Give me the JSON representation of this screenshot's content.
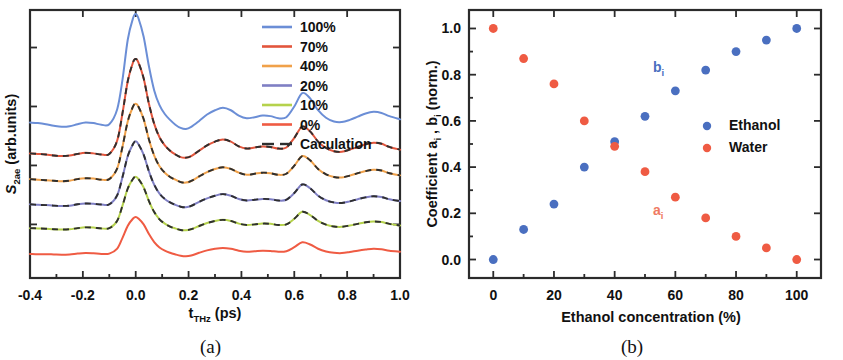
{
  "figure": {
    "width": 843,
    "height": 360,
    "background": "#ffffff"
  },
  "panel_a": {
    "caption": "(a)",
    "xlabel_main": "t",
    "xlabel_sub": "THz",
    "xlabel_unit": " (ps)",
    "ylabel_main": "S",
    "ylabel_sub": "2ae",
    "ylabel_unit": " (arb.units)",
    "legend": [
      {
        "label": "100%",
        "color": "#6b8ed6"
      },
      {
        "label": "70%",
        "color": "#e2553c"
      },
      {
        "label": "40%",
        "color": "#f0a14a"
      },
      {
        "label": "20%",
        "color": "#7f7fc4"
      },
      {
        "label": "10%",
        "color": "#b5d24c"
      },
      {
        "label": "0%",
        "color": "#ef5b43"
      },
      {
        "label": "Caculation",
        "color": "#2f2f2f",
        "dashed": true
      }
    ]
  },
  "panel_b": {
    "caption": "(b)",
    "xlabel": "Ethanol concentration (%)",
    "ylabel_pre": "Coefficient a",
    "ylabel_sub1": "i",
    "ylabel_mid": " , b",
    "ylabel_sub2": "i",
    "ylabel_post": " (norm.)",
    "legend": [
      {
        "label": "Ethanol",
        "color": "#4a6fc0"
      },
      {
        "label": "Water",
        "color": "#ef5b43"
      }
    ],
    "annotations": [
      {
        "main": "b",
        "sub": "i",
        "color": "#4a6fc0"
      },
      {
        "main": "a",
        "sub": "i",
        "color": "#ef7a63"
      }
    ]
  },
  "chart_data": [
    {
      "type": "line",
      "panel": "(a)",
      "title": "",
      "xlabel": "t_THz (ps)",
      "ylabel": "S_2ae (arb.units)",
      "xlim": [
        -0.4,
        1.0
      ],
      "ylim": [
        0,
        1
      ],
      "xticks": [
        "-0.4",
        "-0.2",
        "0.0",
        "0.2",
        "0.4",
        "0.6",
        "0.8",
        "1.0"
      ],
      "xtick_values": [
        -0.4,
        -0.2,
        0.0,
        0.2,
        0.4,
        0.6,
        0.8,
        1.0
      ],
      "yticks": [],
      "ytick_labels": [],
      "grid": false,
      "legend_position": "top-right",
      "note": "Curves are vertically offset THz waveform traces; y axis is arbitrary units with unlabeled tick marks.",
      "x": [
        -0.4,
        -0.37,
        -0.34,
        -0.31,
        -0.28,
        -0.25,
        -0.22,
        -0.19,
        -0.16,
        -0.13,
        -0.1,
        -0.07,
        -0.05,
        -0.03,
        -0.01,
        0.0,
        0.01,
        0.03,
        0.05,
        0.07,
        0.09,
        0.11,
        0.13,
        0.15,
        0.17,
        0.19,
        0.21,
        0.24,
        0.27,
        0.3,
        0.33,
        0.36,
        0.39,
        0.42,
        0.45,
        0.48,
        0.51,
        0.54,
        0.57,
        0.6,
        0.63,
        0.66,
        0.69,
        0.72,
        0.75,
        0.78,
        0.81,
        0.84,
        0.87,
        0.9,
        0.93,
        0.96,
        1.0
      ],
      "series": [
        {
          "name": "100%",
          "color": "#6b8ed6",
          "offset": 0.54,
          "values": [
            0.04,
            0.038,
            0.034,
            0.028,
            0.024,
            0.026,
            0.034,
            0.04,
            0.038,
            0.032,
            0.034,
            0.09,
            0.2,
            0.35,
            0.43,
            0.445,
            0.43,
            0.36,
            0.25,
            0.16,
            0.105,
            0.072,
            0.05,
            0.032,
            0.02,
            0.016,
            0.024,
            0.046,
            0.07,
            0.086,
            0.095,
            0.086,
            0.066,
            0.056,
            0.06,
            0.066,
            0.064,
            0.056,
            0.06,
            0.1,
            0.15,
            0.13,
            0.086,
            0.058,
            0.044,
            0.042,
            0.05,
            0.062,
            0.074,
            0.08,
            0.076,
            0.064,
            0.052
          ]
        },
        {
          "name": "70%",
          "color": "#e2553c",
          "offset": 0.435,
          "values": [
            0.03,
            0.028,
            0.026,
            0.022,
            0.02,
            0.022,
            0.028,
            0.032,
            0.03,
            0.026,
            0.028,
            0.078,
            0.18,
            0.3,
            0.37,
            0.382,
            0.37,
            0.31,
            0.215,
            0.14,
            0.09,
            0.06,
            0.04,
            0.026,
            0.016,
            0.014,
            0.02,
            0.04,
            0.06,
            0.074,
            0.082,
            0.074,
            0.056,
            0.048,
            0.052,
            0.056,
            0.054,
            0.048,
            0.052,
            0.088,
            0.13,
            0.112,
            0.074,
            0.05,
            0.038,
            0.036,
            0.044,
            0.054,
            0.064,
            0.07,
            0.066,
            0.054,
            0.044
          ]
        },
        {
          "name": "40%",
          "color": "#f0a14a",
          "offset": 0.345,
          "values": [
            0.024,
            0.022,
            0.02,
            0.018,
            0.016,
            0.018,
            0.024,
            0.027,
            0.026,
            0.022,
            0.024,
            0.064,
            0.145,
            0.24,
            0.295,
            0.305,
            0.295,
            0.248,
            0.172,
            0.112,
            0.072,
            0.048,
            0.032,
            0.022,
            0.013,
            0.011,
            0.017,
            0.034,
            0.05,
            0.062,
            0.068,
            0.062,
            0.048,
            0.04,
            0.044,
            0.048,
            0.046,
            0.04,
            0.044,
            0.074,
            0.11,
            0.094,
            0.062,
            0.042,
            0.032,
            0.03,
            0.037,
            0.046,
            0.054,
            0.059,
            0.056,
            0.046,
            0.038
          ]
        },
        {
          "name": "20%",
          "color": "#7f7fc4",
          "offset": 0.255,
          "values": [
            0.02,
            0.018,
            0.017,
            0.015,
            0.014,
            0.015,
            0.02,
            0.023,
            0.022,
            0.019,
            0.02,
            0.054,
            0.122,
            0.2,
            0.245,
            0.255,
            0.245,
            0.205,
            0.143,
            0.093,
            0.06,
            0.04,
            0.027,
            0.018,
            0.011,
            0.009,
            0.014,
            0.029,
            0.042,
            0.052,
            0.058,
            0.052,
            0.04,
            0.034,
            0.037,
            0.04,
            0.039,
            0.034,
            0.037,
            0.062,
            0.094,
            0.08,
            0.052,
            0.035,
            0.027,
            0.025,
            0.031,
            0.039,
            0.046,
            0.05,
            0.047,
            0.039,
            0.032
          ]
        },
        {
          "name": "10%",
          "color": "#b5d24c",
          "offset": 0.17,
          "values": [
            0.016,
            0.015,
            0.014,
            0.012,
            0.011,
            0.012,
            0.016,
            0.019,
            0.018,
            0.015,
            0.016,
            0.044,
            0.1,
            0.164,
            0.2,
            0.208,
            0.2,
            0.168,
            0.117,
            0.076,
            0.049,
            0.033,
            0.022,
            0.015,
            0.009,
            0.008,
            0.012,
            0.024,
            0.035,
            0.043,
            0.047,
            0.043,
            0.033,
            0.028,
            0.03,
            0.033,
            0.032,
            0.028,
            0.03,
            0.051,
            0.077,
            0.065,
            0.043,
            0.029,
            0.022,
            0.021,
            0.026,
            0.032,
            0.038,
            0.041,
            0.039,
            0.032,
            0.026
          ]
        },
        {
          "name": "0%",
          "color": "#ef5b43",
          "offset": 0.08,
          "values": [
            0.01,
            0.009,
            0.009,
            0.008,
            0.007,
            0.008,
            0.011,
            0.013,
            0.012,
            0.01,
            0.011,
            0.03,
            0.07,
            0.115,
            0.142,
            0.148,
            0.142,
            0.12,
            0.084,
            0.054,
            0.034,
            0.022,
            0.014,
            0.008,
            0.003,
            0.001,
            0.004,
            0.014,
            0.023,
            0.029,
            0.032,
            0.029,
            0.022,
            0.018,
            0.02,
            0.022,
            0.021,
            0.018,
            0.02,
            0.035,
            0.053,
            0.045,
            0.029,
            0.019,
            0.014,
            0.013,
            0.017,
            0.022,
            0.026,
            0.029,
            0.027,
            0.022,
            0.018
          ]
        }
      ],
      "calculation_overlay": {
        "name": "Caculation",
        "color": "#2f2f2f",
        "style": "dashed",
        "applies_to": [
          "70%",
          "40%",
          "20%",
          "10%"
        ]
      }
    },
    {
      "type": "scatter",
      "panel": "(b)",
      "title": "",
      "xlabel": "Ethanol concentration (%)",
      "ylabel": "Coefficient a_i , b_i (norm.)",
      "xlim": [
        -8,
        108
      ],
      "ylim": [
        -0.08,
        1.08
      ],
      "xticks": [
        "0",
        "20",
        "40",
        "60",
        "80",
        "100"
      ],
      "xtick_values": [
        0,
        20,
        40,
        60,
        80,
        100
      ],
      "xminor_values": [
        10,
        30,
        50,
        70,
        90
      ],
      "yticks": [
        "0.0",
        "0.2",
        "0.4",
        "0.6",
        "0.8",
        "1.0"
      ],
      "ytick_values": [
        0.0,
        0.2,
        0.4,
        0.6,
        0.8,
        1.0
      ],
      "grid": false,
      "legend_position": "right-middle",
      "x": [
        0,
        10,
        20,
        30,
        40,
        50,
        60,
        70,
        80,
        90,
        100
      ],
      "series": [
        {
          "name": "Ethanol",
          "symbol": "b_i",
          "color": "#4a6fc0",
          "values": [
            0.0,
            0.13,
            0.24,
            0.4,
            0.51,
            0.62,
            0.73,
            0.82,
            0.9,
            0.95,
            1.0
          ]
        },
        {
          "name": "Water",
          "symbol": "a_i",
          "color": "#ef5b43",
          "values": [
            1.0,
            0.87,
            0.76,
            0.6,
            0.49,
            0.38,
            0.27,
            0.18,
            0.1,
            0.05,
            0.0
          ]
        }
      ]
    }
  ]
}
